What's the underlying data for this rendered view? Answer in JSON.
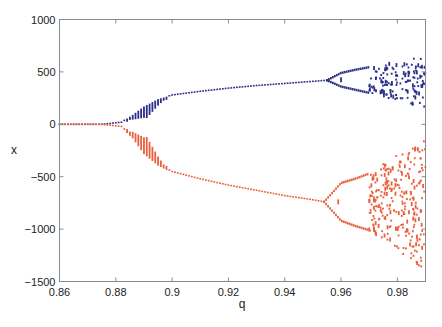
{
  "chart_data": {
    "type": "scatter",
    "title": "",
    "xlabel": "q",
    "ylabel": "x",
    "xlim": [
      0.86,
      0.99
    ],
    "ylim": [
      -1500,
      1000
    ],
    "grid": false,
    "legend": "none",
    "xticks": [
      0.86,
      0.88,
      0.9,
      0.92,
      0.94,
      0.96,
      0.98
    ],
    "xtick_labels": [
      "0.86",
      "0.88",
      "0.9",
      "0.92",
      "0.94",
      "0.96",
      "0.98"
    ],
    "yticks": [
      1000,
      500,
      0,
      -500,
      -1000,
      -1500
    ],
    "ytick_labels": [
      "1000",
      "500",
      "0",
      "−500",
      "−1000",
      "−1500"
    ],
    "series": [
      {
        "name": "upper branch",
        "color": "#2b2f8a",
        "q_step": 0.001,
        "curve": [
          [
            0.86,
            0
          ],
          [
            0.875,
            0
          ],
          [
            0.882,
            20
          ],
          [
            0.886,
            90
          ],
          [
            0.89,
            170
          ],
          [
            0.895,
            240
          ],
          [
            0.9,
            280
          ],
          [
            0.91,
            315
          ],
          [
            0.92,
            345
          ],
          [
            0.93,
            370
          ],
          [
            0.94,
            390
          ],
          [
            0.95,
            410
          ],
          [
            0.955,
            420
          ]
        ],
        "sweep_range": [
          0.884,
          0.898
        ],
        "sweep_spread": 110,
        "bifurcation": {
          "start": 0.955,
          "upper": [
            [
              0.955,
              420
            ],
            [
              0.96,
              490
            ],
            [
              0.965,
              520
            ],
            [
              0.97,
              545
            ]
          ],
          "lower": [
            [
              0.955,
              420
            ],
            [
              0.96,
              360
            ],
            [
              0.965,
              330
            ],
            [
              0.97,
              300
            ]
          ]
        },
        "chaos": {
          "start": 0.97,
          "end": 0.99,
          "min": 150,
          "max": 650,
          "points": 150
        }
      },
      {
        "name": "lower branch",
        "color": "#e8603c",
        "q_step": 0.001,
        "curve": [
          [
            0.86,
            0
          ],
          [
            0.875,
            0
          ],
          [
            0.882,
            -20
          ],
          [
            0.886,
            -120
          ],
          [
            0.89,
            -270
          ],
          [
            0.895,
            -380
          ],
          [
            0.9,
            -450
          ],
          [
            0.91,
            -520
          ],
          [
            0.92,
            -580
          ],
          [
            0.93,
            -630
          ],
          [
            0.94,
            -680
          ],
          [
            0.95,
            -720
          ],
          [
            0.954,
            -740
          ]
        ],
        "sweep_range": [
          0.884,
          0.898
        ],
        "sweep_spread": 170,
        "bifurcation": {
          "start": 0.954,
          "upper": [
            [
              0.954,
              -740
            ],
            [
              0.96,
              -560
            ],
            [
              0.965,
              -520
            ],
            [
              0.97,
              -470
            ]
          ],
          "lower": [
            [
              0.954,
              -740
            ],
            [
              0.96,
              -920
            ],
            [
              0.965,
              -970
            ],
            [
              0.97,
              -1010
            ]
          ]
        },
        "chaos": {
          "start": 0.97,
          "end": 0.99,
          "min": -1400,
          "max": -100,
          "points": 260
        }
      }
    ]
  }
}
